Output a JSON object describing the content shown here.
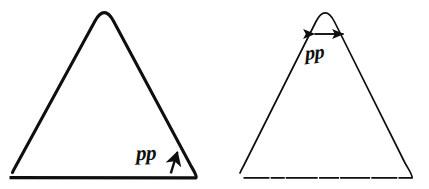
{
  "figure": {
    "background_color": "#ffffff",
    "ink_color": "#100f0d",
    "width": 429,
    "height": 189,
    "panels": [
      {
        "id": "left-panel",
        "name": "left-triangle-panel",
        "shape": "triangle",
        "stroke_color": "#100f0d",
        "stroke_width_px": 3.1,
        "apex": {
          "x": 104,
          "y": 13
        },
        "left_foot": {
          "x": 12,
          "y": 172
        },
        "right_foot": {
          "x": 196,
          "y": 172
        },
        "baseline": {
          "x1": 9,
          "y1": 178,
          "x2": 199,
          "y2": 178,
          "stroke_width_px": 3.4
        },
        "label": {
          "text": "pp",
          "x": 136,
          "y": 141,
          "font_size_px": 21,
          "style": "bold-italic-serif"
        },
        "arrow": {
          "type": "single-headed",
          "orientation": "diagonal-up-right",
          "x1": 171,
          "y1": 172,
          "x2": 178,
          "y2": 150
        }
      },
      {
        "id": "right-panel",
        "name": "right-triangle-panel",
        "shape": "triangle",
        "stroke_color": "#100f0d",
        "stroke_width_px": 1.7,
        "apex": {
          "x": 325,
          "y": 13
        },
        "left_foot": {
          "x": 240,
          "y": 172
        },
        "right_foot": {
          "x": 412,
          "y": 172
        },
        "baseline": {
          "x1": 243,
          "y1": 178,
          "x2": 413,
          "y2": 178,
          "stroke_width_px": 1.8
        },
        "label": {
          "text": "pp",
          "x": 305,
          "y": 41,
          "font_size_px": 20,
          "style": "bold-italic-serif"
        },
        "arrow": {
          "type": "double-headed",
          "orientation": "horizontal",
          "x1": 313,
          "y1": 34,
          "x2": 345,
          "y2": 34
        }
      }
    ]
  }
}
